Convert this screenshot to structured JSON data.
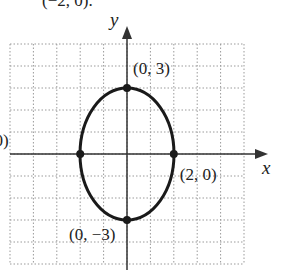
{
  "top_text_clipped": "(−2, 0).",
  "chart_data": {
    "type": "line",
    "title": "",
    "xlabel": "x",
    "ylabel": "y",
    "xlim": [
      -5,
      5
    ],
    "ylim": [
      -5,
      5
    ],
    "grid": true,
    "curve": "ellipse x^2/4 + y^2/9 = 1",
    "points": [
      {
        "x": 0,
        "y": 3,
        "label": "(0, 3)"
      },
      {
        "x": -2,
        "y": 0,
        "label": "(−2, 0)"
      },
      {
        "x": 2,
        "y": 0,
        "label": "(2, 0)"
      },
      {
        "x": 0,
        "y": -3,
        "label": "(0, −3)"
      }
    ]
  },
  "colors": {
    "curve": "#1a1a1a",
    "grid": "#9a9a9a",
    "axis": "#333333"
  }
}
